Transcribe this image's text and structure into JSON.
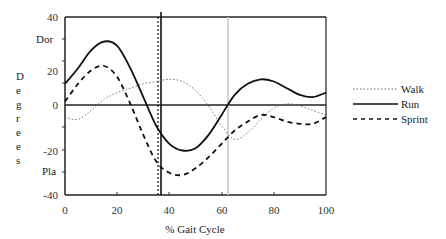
{
  "chart_data": {
    "type": "line",
    "title": "",
    "xlabel": "% Gait Cycle",
    "ylabel": "Degrees",
    "xlim": [
      0,
      100
    ],
    "ylim": [
      -40,
      40
    ],
    "x_ticks": [
      "0",
      "20",
      "40",
      "60",
      "80",
      "100"
    ],
    "y_ticks": [
      "40",
      "20",
      "0",
      "-20",
      "-40"
    ],
    "annotations": {
      "top": "Dor",
      "bottom": "Pla"
    },
    "legend": [
      "Walk",
      "Run",
      "Sprint"
    ],
    "legend_position": "right",
    "grid": false,
    "reference_lines": [
      {
        "x": 36,
        "style": "dotted",
        "color": "#222222"
      },
      {
        "x": 37,
        "style": "solid",
        "color": "#111111"
      },
      {
        "x": 62,
        "style": "solid",
        "color": "#bbbbbb"
      }
    ],
    "x": [
      0,
      5,
      10,
      15,
      20,
      25,
      30,
      35,
      40,
      45,
      50,
      55,
      60,
      65,
      70,
      75,
      80,
      85,
      90,
      95,
      100
    ],
    "series": [
      {
        "name": "Walk",
        "style": "dotted",
        "values": [
          -5,
          -6,
          -2,
          3,
          6,
          8,
          10,
          11,
          12,
          11,
          7,
          0,
          -9,
          -15,
          -12,
          -6,
          -1,
          1,
          0,
          -2,
          -4
        ]
      },
      {
        "name": "Run",
        "style": "solid",
        "values": [
          10,
          17,
          25,
          29,
          27,
          17,
          4,
          -9,
          -17,
          -20,
          -19,
          -13,
          -4,
          5,
          10,
          12,
          11,
          8,
          5,
          4,
          6
        ]
      },
      {
        "name": "Sprint",
        "style": "dashed",
        "values": [
          2,
          10,
          16,
          18,
          13,
          1,
          -13,
          -25,
          -30,
          -31,
          -28,
          -23,
          -17,
          -11,
          -7,
          -4,
          -5,
          -7,
          -8,
          -8,
          -5
        ]
      }
    ]
  },
  "labels": {
    "xlabel": "% Gait Cycle",
    "ylabel_letters": [
      "D",
      "e",
      "g",
      "r",
      "e",
      "e",
      "s"
    ],
    "dor": "Dor",
    "pla": "Pla",
    "y_ticks": [
      "40",
      "20",
      "0",
      "-20",
      "-40"
    ],
    "x_ticks": [
      "0",
      "20",
      "40",
      "60",
      "80",
      "100"
    ],
    "legend": [
      "Walk",
      "Run",
      "Sprint"
    ]
  }
}
